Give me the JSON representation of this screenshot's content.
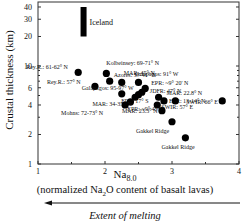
{
  "chart_data": {
    "type": "scatter",
    "title": "",
    "xlabel_main": "Na",
    "xlabel_sub": "8.0",
    "xlabel_desc": "(normalized Na2O content of basalt lavas)",
    "xlabel_desc_parts": [
      "(normalized Na",
      "2",
      "O content of basalt lavas)"
    ],
    "arrow_label": "Extent of melting",
    "arrow_direction": "left",
    "ylabel": "Crustal thickness (km)",
    "xlim": [
      1,
      4
    ],
    "ylim": [
      1,
      50
    ],
    "yscale": "log",
    "xticks": [
      1,
      2,
      3,
      4
    ],
    "yticks": [
      1,
      2,
      4,
      6,
      10,
      20,
      30,
      40
    ],
    "grid": false,
    "legend": null,
    "iceland_bar": {
      "label": "Iceland",
      "x": 1.68,
      "y_range": [
        20,
        40
      ]
    },
    "points": [
      {
        "label": "Rey.R.: 61-62° N",
        "x": 1.6,
        "y": 8.6
      },
      {
        "label": "Kolbeinsey: 69-71° N",
        "x": 2.02,
        "y": 8.4
      },
      {
        "label": "Azores: 37-41° N",
        "x": 2.07,
        "y": 7.0
      },
      {
        "label": "Rey.R.: 57° N",
        "x": 1.85,
        "y": 6.2
      },
      {
        "label": "MAR: 45° N",
        "x": 2.25,
        "y": 6.8
      },
      {
        "label": "Galapagos: 91° W",
        "x": 2.5,
        "y": 6.8
      },
      {
        "label": "Galapagos: 95-97° W",
        "x": 2.25,
        "y": 5.2
      },
      {
        "label": "EPR: ~9° 20' N",
        "x": 2.6,
        "y": 5.9
      },
      {
        "label": "JDFR: 47° N",
        "x": 2.55,
        "y": 5.4
      },
      {
        "label": "MAR: 22.8° N",
        "x": 2.8,
        "y": 4.8
      },
      {
        "label": "EPR: 13-14° N",
        "x": 2.88,
        "y": 4.4
      },
      {
        "label": "EPR: 17° S",
        "x": 2.45,
        "y": 4.8
      },
      {
        "label": "EPR",
        "x": 2.5,
        "y": 5.1
      },
      {
        "label": "MAR: 34-35° N",
        "x": 2.38,
        "y": 4.3
      },
      {
        "label": "Mohns: 72-73° N",
        "x": 2.3,
        "y": 4.0
      },
      {
        "label": "EPR: ~9° 45' N",
        "x": 2.78,
        "y": 4.0
      },
      {
        "label": "SWIR: 57° E",
        "x": 3.05,
        "y": 4.4
      },
      {
        "label": "SWIR: 66° E",
        "x": 3.75,
        "y": 4.4
      },
      {
        "label": "MAR: 23.3° N",
        "x": 2.85,
        "y": 3.5
      },
      {
        "label": "Gakkel Ridge",
        "x": 3.0,
        "y": 2.7
      },
      {
        "label": "Gakkel Ridge",
        "x": 3.2,
        "y": 1.85
      }
    ]
  }
}
